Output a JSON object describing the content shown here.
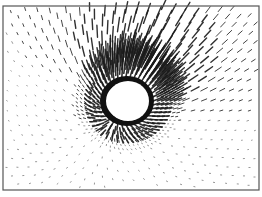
{
  "chart_data": {
    "type": "quiver",
    "title": "",
    "xlabel": "",
    "ylabel": "",
    "grid": false,
    "legend": null,
    "frame": {
      "x": 3,
      "y": 6,
      "width": 256,
      "height": 184,
      "stroke": "#555555"
    },
    "obstacle": {
      "cx": 128,
      "cy": 101,
      "rx": 21,
      "ry": 20,
      "fill": "#ffffff"
    },
    "ring": {
      "cx": 127,
      "cy": 101,
      "rx": 27,
      "ry": 25,
      "color": "#111111"
    },
    "field": {
      "description": "Vector field radiating strongly from a dense ring around an elliptical void; long arrows fan toward the upper-right, short tick marks and dots elsewhere",
      "grid_step_outer": 14,
      "grid_step_inner": 6,
      "dominant_direction": "up-right",
      "arrow_color": "#1a1a1a"
    }
  },
  "colors": {
    "background": "#ffffff",
    "arrows": "#1a1a1a",
    "frame": "#555555"
  }
}
